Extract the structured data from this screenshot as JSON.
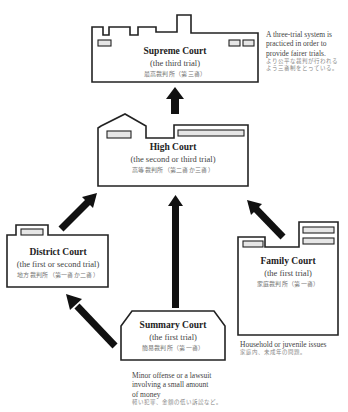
{
  "diagram": {
    "type": "court-hierarchy",
    "courts": [
      {
        "id": "supreme",
        "name": "Supreme Court",
        "trial": "(the third trial)",
        "jp": "最高裁判所（第三審）"
      },
      {
        "id": "high",
        "name": "High Court",
        "trial": "(the second or third trial)",
        "jp": "高等裁判所（第二審か三審）"
      },
      {
        "id": "district",
        "name": "District Court",
        "trial": "(the first or second trial)",
        "jp": "地方裁判所（第一審か二審）"
      },
      {
        "id": "family",
        "name": "Family Court",
        "trial": "(the first trial)",
        "jp": "家庭裁判所（第一審）"
      },
      {
        "id": "summary",
        "name": "Summary Court",
        "trial": "(the first trial)",
        "jp": "簡易裁判所（第一審）"
      }
    ],
    "notes": {
      "supreme": {
        "en_lines": [
          "A three-trial system is",
          "practiced in order to",
          "provide fairer trials."
        ],
        "jp_lines": [
          "より公平な裁判が行われる",
          "よう三審制をとっている。"
        ]
      },
      "family": {
        "en_lines": [
          "Household or juvenile issues"
        ],
        "jp_lines": [
          "家庭内、未成年の問題。"
        ]
      },
      "summary": {
        "en_lines": [
          "Minor offense or a lawsuit",
          "involving a small amount",
          "of money"
        ],
        "jp_lines": [
          "軽い犯罪、金額の低い訴訟など。"
        ]
      }
    },
    "edges": [
      {
        "from": "high",
        "to": "supreme"
      },
      {
        "from": "district",
        "to": "high"
      },
      {
        "from": "family",
        "to": "high"
      },
      {
        "from": "summary",
        "to": "high"
      },
      {
        "from": "summary",
        "to": "district"
      }
    ],
    "colors": {
      "line": "#222222",
      "arrow": "#111111",
      "window_fill": "#e6e6e6",
      "text_jp": "#777777"
    }
  }
}
